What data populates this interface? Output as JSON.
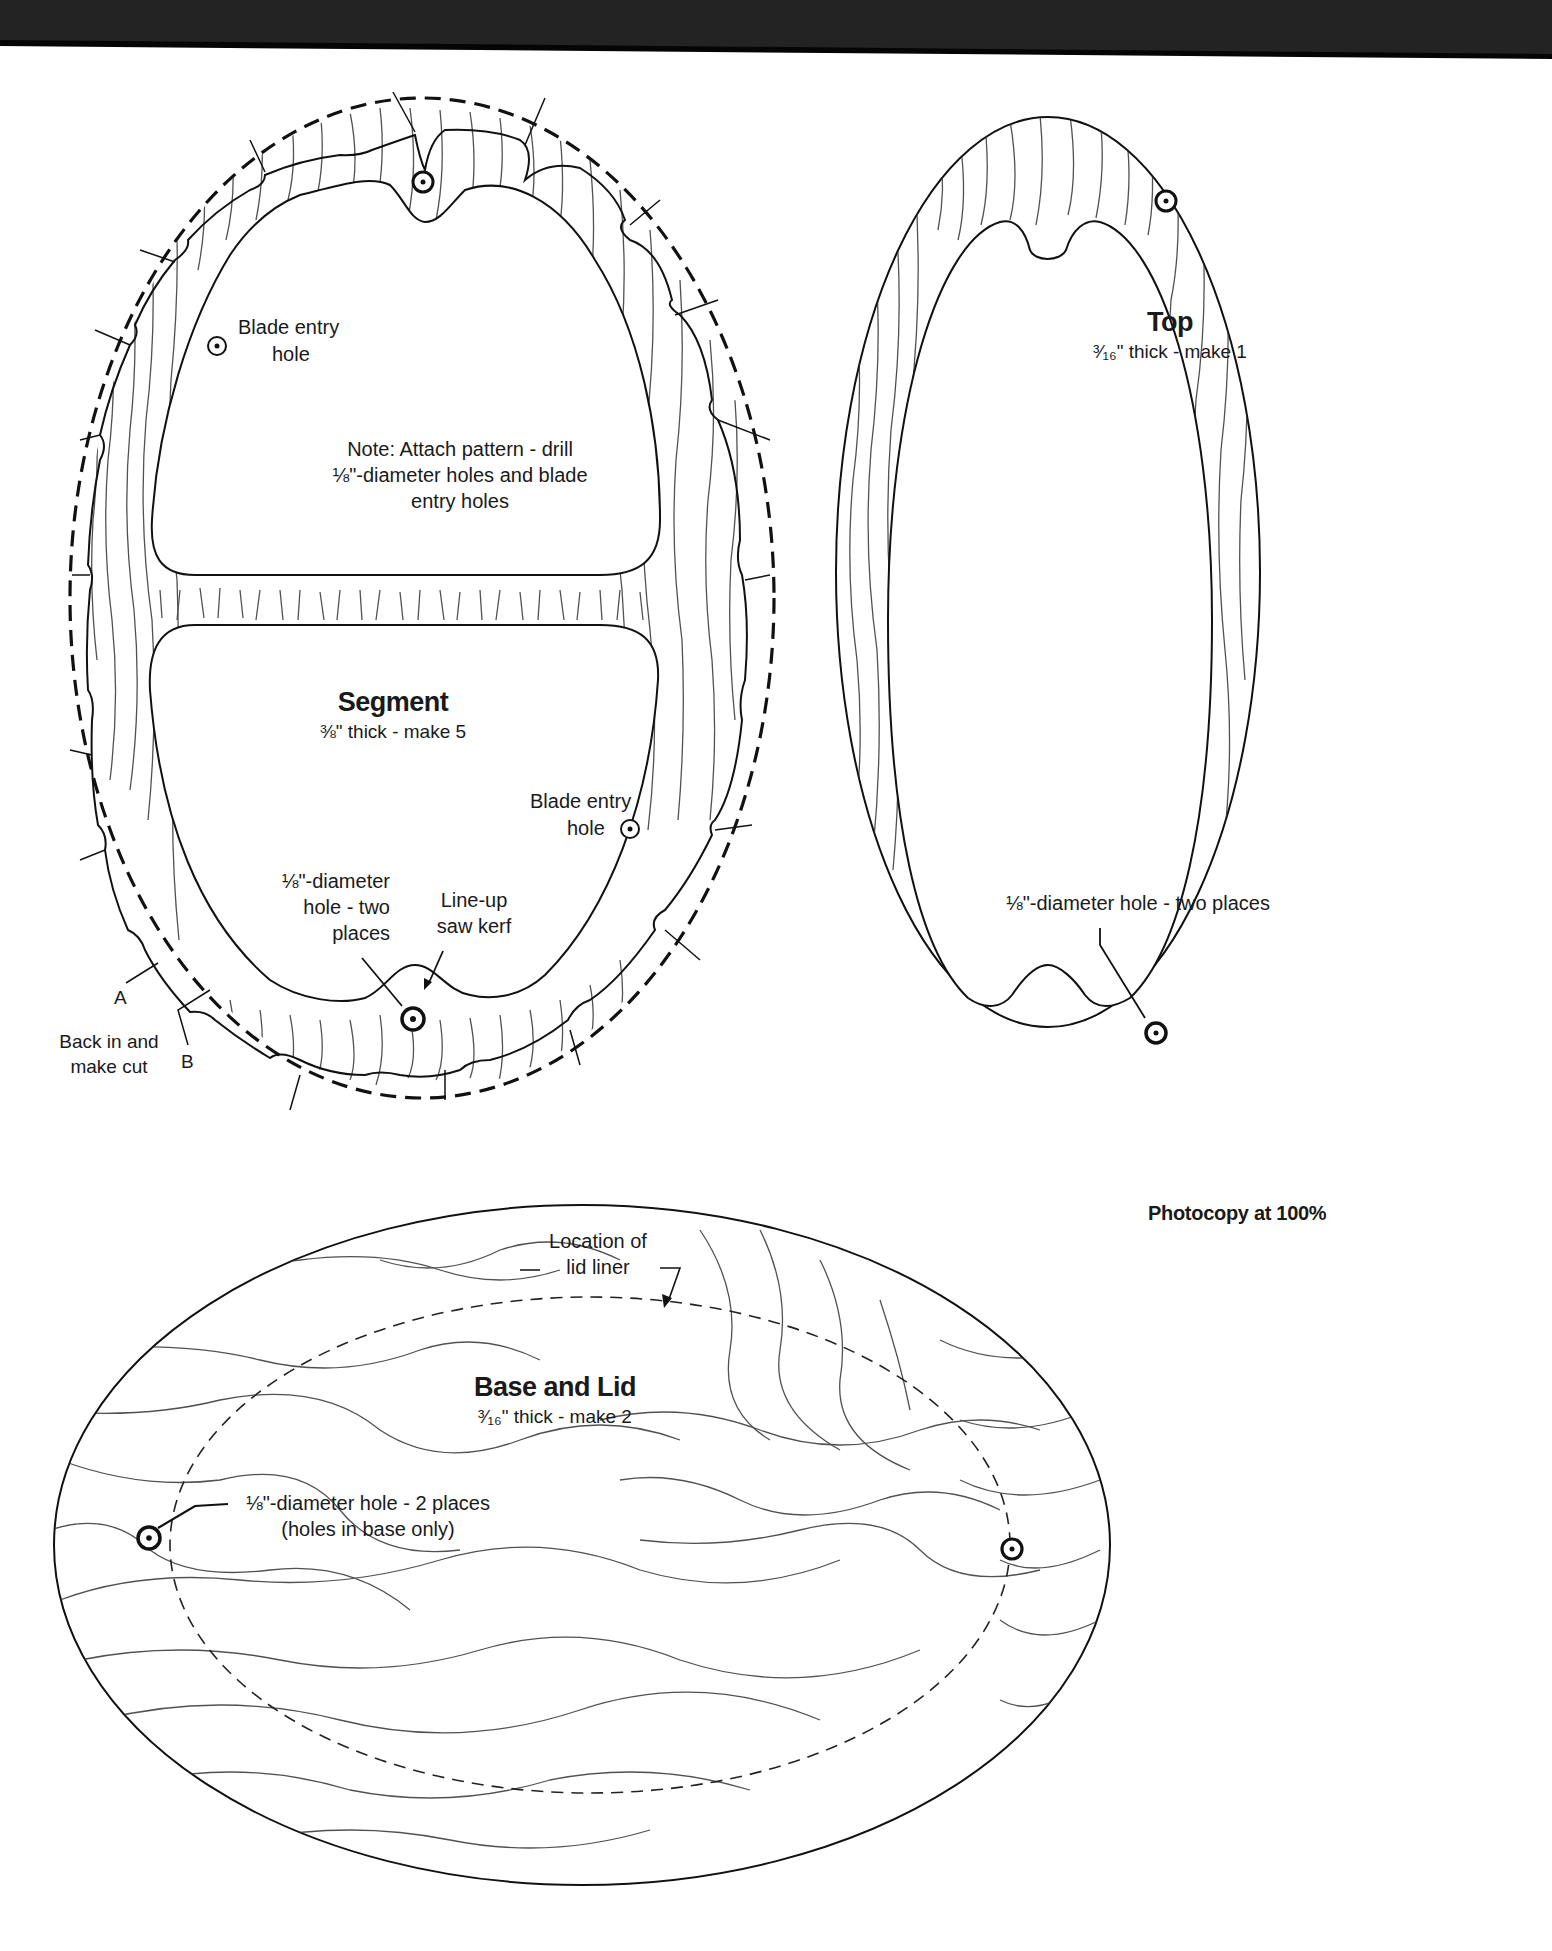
{
  "page": {
    "scan_band_color": "#222222",
    "paper_color": "#ffffff",
    "ink_color": "#1a1a1a",
    "footer_note": "Photocopy at 100%"
  },
  "segment": {
    "title": "Segment",
    "spec": "⅜\" thick - make 5",
    "note_lines": [
      "Note: Attach pattern - drill",
      "⅛\"-diameter holes and blade",
      "entry holes"
    ],
    "blade_entry_upper": [
      "Blade entry",
      "hole"
    ],
    "blade_entry_lower": [
      "Blade entry",
      "hole"
    ],
    "hole_label": [
      "⅛\"-diameter",
      "hole - two",
      "places"
    ],
    "lineup_label": [
      "Line-up",
      "saw kerf"
    ],
    "marker_a": "A",
    "marker_b": "B",
    "back_in_label": [
      "Back in and",
      "make cut"
    ],
    "icons": [
      "drill-hole-icon",
      "blade-entry-hole-icon",
      "cut-arrow-icon"
    ]
  },
  "top": {
    "title": "Top",
    "spec": "³⁄₁₆\" thick - make 1",
    "hole_label": "⅛\"-diameter hole - two places",
    "icons": [
      "drill-hole-icon"
    ]
  },
  "base_lid": {
    "title": "Base and Lid",
    "spec": "³⁄₁₆\" thick - make 2",
    "liner_label": [
      "Location of",
      "lid liner"
    ],
    "hole_label": [
      "⅛\"-diameter hole - 2 places",
      "(holes in base only)"
    ],
    "icons": [
      "drill-hole-icon",
      "lid-liner-outline"
    ]
  }
}
